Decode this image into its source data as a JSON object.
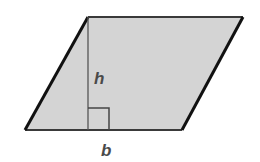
{
  "diagram": {
    "shape": "parallelogram",
    "fill_color": "#d4d4d4",
    "stroke_color": "#1a1a1a",
    "label_color": "#4a4a4a",
    "vertices": {
      "top_left": [
        88,
        17
      ],
      "top_right": [
        243,
        17
      ],
      "bottom_right": [
        182,
        130
      ],
      "bottom_left": [
        25,
        130
      ]
    },
    "height_line": {
      "x": 88,
      "y1": 17,
      "y2": 130
    },
    "right_angle_marker": {
      "x": 88,
      "y": 108,
      "size": 21
    },
    "labels": {
      "height": "h",
      "base": "b"
    }
  }
}
